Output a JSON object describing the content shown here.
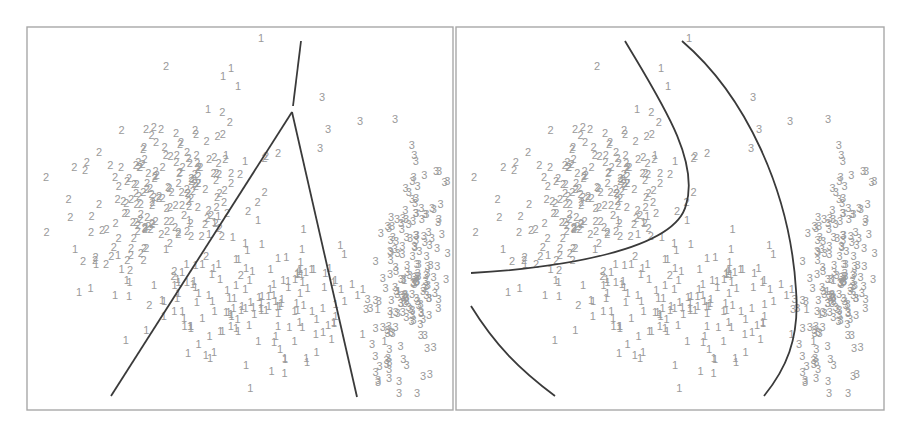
{
  "chart_data": [
    {
      "type": "scatter",
      "panel": "left",
      "title": "",
      "xlabel": "",
      "ylabel": "",
      "grid": false,
      "legend": "none",
      "marker_style": "class digit labels",
      "classes": [
        "1",
        "2",
        "3"
      ],
      "frame": {
        "x": 27,
        "y": 27,
        "w": 426,
        "h": 383
      },
      "boundary_type": "linear",
      "boundaries": [
        {
          "name": "top-stub",
          "points": [
            [
              301,
              41
            ],
            [
              293,
              106
            ]
          ]
        },
        {
          "name": "left-line",
          "points": [
            [
              292,
              112
            ],
            [
              111,
              396
            ]
          ]
        },
        {
          "name": "right-line",
          "points": [
            [
              292,
              112
            ],
            [
              357,
              397
            ]
          ]
        }
      ],
      "clusters": [
        {
          "class": "2",
          "cx": 165,
          "cy": 200,
          "sx": 40,
          "sy": 40,
          "n": 190,
          "seed": 11
        },
        {
          "class": "1",
          "cx": 250,
          "cy": 300,
          "sx": 60,
          "sy": 30,
          "n": 170,
          "seed": 23
        },
        {
          "class": "3",
          "cx": 405,
          "cy": 280,
          "sx": 16,
          "sy": 55,
          "n": 180,
          "seed": 37
        }
      ],
      "outliers": [
        {
          "class": "1",
          "x": 258,
          "y": 42
        },
        {
          "class": "2",
          "x": 163,
          "y": 70
        },
        {
          "class": "1",
          "x": 220,
          "y": 80
        },
        {
          "class": "1",
          "x": 228,
          "y": 72
        },
        {
          "class": "1",
          "x": 235,
          "y": 90
        },
        {
          "class": "1",
          "x": 205,
          "y": 113
        },
        {
          "class": "2",
          "x": 43,
          "y": 181
        },
        {
          "class": "3",
          "x": 319,
          "y": 101
        },
        {
          "class": "3",
          "x": 357,
          "y": 125
        },
        {
          "class": "3",
          "x": 392,
          "y": 123
        },
        {
          "class": "3",
          "x": 317,
          "y": 152
        },
        {
          "class": "3",
          "x": 325,
          "y": 133
        },
        {
          "class": "1",
          "x": 223,
          "y": 159
        },
        {
          "class": "1",
          "x": 242,
          "y": 165
        },
        {
          "class": "2",
          "x": 237,
          "y": 178
        },
        {
          "class": "1",
          "x": 76,
          "y": 296
        },
        {
          "class": "1",
          "x": 112,
          "y": 299
        },
        {
          "class": "1",
          "x": 126,
          "y": 300
        },
        {
          "class": "1",
          "x": 185,
          "y": 357
        },
        {
          "class": "1",
          "x": 207,
          "y": 362
        },
        {
          "class": "1",
          "x": 282,
          "y": 363
        },
        {
          "class": "3",
          "x": 386,
          "y": 373
        },
        {
          "class": "3",
          "x": 396,
          "y": 385
        },
        {
          "class": "3",
          "x": 420,
          "y": 380
        },
        {
          "class": "3",
          "x": 396,
          "y": 397
        },
        {
          "class": "3",
          "x": 414,
          "y": 397
        },
        {
          "class": "2",
          "x": 88,
          "y": 236
        },
        {
          "class": "2",
          "x": 96,
          "y": 208
        },
        {
          "class": "1",
          "x": 72,
          "y": 253
        },
        {
          "class": "1",
          "x": 93,
          "y": 268
        },
        {
          "class": "2",
          "x": 103,
          "y": 268
        },
        {
          "class": "1",
          "x": 115,
          "y": 259
        }
      ]
    },
    {
      "type": "scatter",
      "panel": "right",
      "title": "",
      "xlabel": "",
      "ylabel": "",
      "grid": false,
      "legend": "none",
      "marker_style": "class digit labels",
      "classes": [
        "1",
        "2",
        "3"
      ],
      "frame": {
        "x": 456,
        "y": 27,
        "w": 428,
        "h": 383
      },
      "boundary_type": "quadratic",
      "boundaries": [
        {
          "name": "curve-a",
          "d": "M625,41 C660,100 700,160 686,205 C675,250 560,268 471,273"
        },
        {
          "name": "curve-b",
          "d": "M682,41 C745,95 790,190 796,290 C800,340 785,370 764,396"
        },
        {
          "name": "curve-c",
          "d": "M471,306 C495,345 520,370 555,396"
        }
      ],
      "clusters": [
        {
          "class": "2",
          "cx": 594,
          "cy": 200,
          "sx": 40,
          "sy": 40,
          "n": 190,
          "seed": 11
        },
        {
          "class": "1",
          "cx": 679,
          "cy": 300,
          "sx": 60,
          "sy": 30,
          "n": 170,
          "seed": 23
        },
        {
          "class": "3",
          "cx": 832,
          "cy": 280,
          "sx": 16,
          "sy": 55,
          "n": 180,
          "seed": 37
        }
      ],
      "outliers": [
        {
          "class": "1",
          "x": 686,
          "y": 42
        },
        {
          "class": "2",
          "x": 594,
          "y": 70
        },
        {
          "class": "1",
          "x": 658,
          "y": 72
        },
        {
          "class": "1",
          "x": 665,
          "y": 90
        },
        {
          "class": "1",
          "x": 634,
          "y": 113
        },
        {
          "class": "2",
          "x": 471,
          "y": 181
        },
        {
          "class": "3",
          "x": 750,
          "y": 101
        },
        {
          "class": "3",
          "x": 787,
          "y": 125
        },
        {
          "class": "3",
          "x": 825,
          "y": 123
        },
        {
          "class": "3",
          "x": 748,
          "y": 152
        },
        {
          "class": "3",
          "x": 756,
          "y": 133
        },
        {
          "class": "1",
          "x": 652,
          "y": 159
        },
        {
          "class": "1",
          "x": 672,
          "y": 165
        },
        {
          "class": "2",
          "x": 667,
          "y": 178
        },
        {
          "class": "1",
          "x": 505,
          "y": 296
        },
        {
          "class": "1",
          "x": 542,
          "y": 299
        },
        {
          "class": "1",
          "x": 556,
          "y": 300
        },
        {
          "class": "1",
          "x": 616,
          "y": 357
        },
        {
          "class": "1",
          "x": 637,
          "y": 362
        },
        {
          "class": "1",
          "x": 712,
          "y": 363
        },
        {
          "class": "3",
          "x": 815,
          "y": 373
        },
        {
          "class": "3",
          "x": 825,
          "y": 385
        },
        {
          "class": "3",
          "x": 850,
          "y": 380
        },
        {
          "class": "3",
          "x": 826,
          "y": 397
        },
        {
          "class": "3",
          "x": 845,
          "y": 397
        },
        {
          "class": "2",
          "x": 516,
          "y": 236
        },
        {
          "class": "2",
          "x": 526,
          "y": 208
        },
        {
          "class": "1",
          "x": 500,
          "y": 253
        },
        {
          "class": "1",
          "x": 522,
          "y": 268
        },
        {
          "class": "2",
          "x": 533,
          "y": 268
        },
        {
          "class": "1",
          "x": 545,
          "y": 259
        }
      ]
    }
  ],
  "style": {
    "label_color": "#9a9a9a",
    "boundary_color": "#3a3a3a",
    "frame_color": "#a8a8a8",
    "background": "#ffffff",
    "label_font_size": 11
  }
}
